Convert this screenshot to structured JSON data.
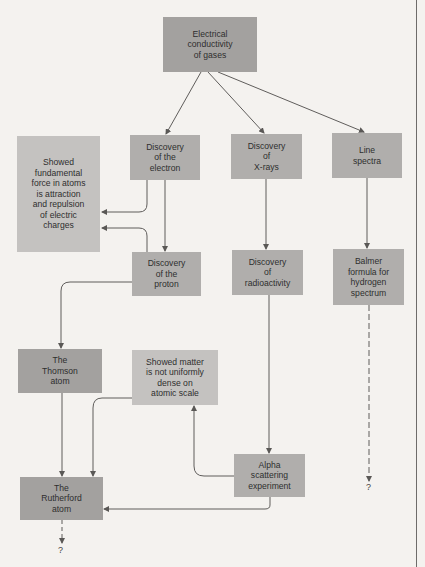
{
  "nodes": {
    "conductivity": "Electrical\nconductivity\nof gases",
    "fundamental_force": "Showed\nfundamental\nforce in atoms\nis attraction\nand repulsion\nof electric\ncharges",
    "electron": "Discovery\nof the\nelectron",
    "xrays": "Discovery\nof\nX-rays",
    "line_spectra": "Line\nspectra",
    "proton": "Discovery\nof the\nproton",
    "radioactivity": "Discovery\nof\nradioactivity",
    "balmer": "Balmer\nformula for\nhydrogen\nspectrum",
    "thomson": "The\nThomson\natom",
    "matter_not_uniform": "Showed matter\nis not uniformly\ndense on\natomic scale",
    "alpha": "Alpha\nscattering\nexperiment",
    "rutherford": "The\nRutherford\natom"
  },
  "unknown_markers": {
    "rutherford_next": "?",
    "balmer_next": "?"
  },
  "edges": [
    {
      "from": "conductivity",
      "to": "electron",
      "style": "solid"
    },
    {
      "from": "conductivity",
      "to": "xrays",
      "style": "solid"
    },
    {
      "from": "conductivity",
      "to": "line_spectra",
      "style": "solid"
    },
    {
      "from": "electron",
      "to": "fundamental_force",
      "style": "solid"
    },
    {
      "from": "electron",
      "to": "proton",
      "style": "solid"
    },
    {
      "from": "proton",
      "to": "fundamental_force",
      "style": "solid"
    },
    {
      "from": "proton",
      "to": "thomson",
      "style": "solid"
    },
    {
      "from": "xrays",
      "to": "radioactivity",
      "style": "solid"
    },
    {
      "from": "line_spectra",
      "to": "balmer",
      "style": "solid"
    },
    {
      "from": "balmer",
      "to": "?",
      "style": "dashed"
    },
    {
      "from": "radioactivity",
      "to": "alpha",
      "style": "solid"
    },
    {
      "from": "alpha",
      "to": "matter_not_uniform",
      "style": "solid"
    },
    {
      "from": "matter_not_uniform",
      "to": "rutherford",
      "style": "solid"
    },
    {
      "from": "thomson",
      "to": "rutherford",
      "style": "solid"
    },
    {
      "from": "alpha",
      "to": "rutherford",
      "style": "solid"
    },
    {
      "from": "rutherford",
      "to": "?",
      "style": "dashed"
    }
  ]
}
